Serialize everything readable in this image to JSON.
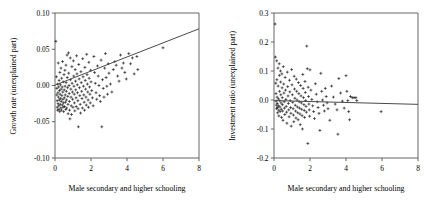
{
  "figure": {
    "background_color": "#ffffff",
    "panel_count": 2
  },
  "chart_data": [
    {
      "type": "scatter",
      "id": "growth-rate-panel",
      "title": "",
      "xlabel": "Male secondary and higher schooling",
      "ylabel": "Growth rate (unexplained part)",
      "xlim": [
        0,
        8
      ],
      "ylim": [
        -0.1,
        0.1
      ],
      "xticks": [
        0,
        2,
        4,
        6,
        8
      ],
      "xticklabels": [
        "0",
        "2",
        "4",
        "6",
        "8"
      ],
      "yticks": [
        -0.1,
        -0.05,
        0.0,
        0.05,
        0.1
      ],
      "yticklabels": [
        "-0.10",
        "-0.05",
        "0.00",
        "0.05",
        "0.10"
      ],
      "grid": false,
      "legend": null,
      "marker": "plus",
      "marker_color": "#0b0b0b",
      "fit_line": {
        "x": [
          0,
          8
        ],
        "y": [
          0.0005,
          0.0782
        ],
        "color": "#4a4a4a"
      },
      "points": [
        [
          0.05,
          0.061
        ],
        [
          0.08,
          0.012
        ],
        [
          0.1,
          -0.004
        ],
        [
          0.1,
          -0.013
        ],
        [
          0.12,
          -0.021
        ],
        [
          0.12,
          -0.03
        ],
        [
          0.14,
          -0.034
        ],
        [
          0.15,
          0.002
        ],
        [
          0.16,
          -0.01
        ],
        [
          0.17,
          -0.025
        ],
        [
          0.18,
          0.031
        ],
        [
          0.19,
          -0.016
        ],
        [
          0.2,
          -0.002
        ],
        [
          0.21,
          -0.028
        ],
        [
          0.22,
          -0.033
        ],
        [
          0.23,
          0.007
        ],
        [
          0.24,
          -0.02
        ],
        [
          0.25,
          -0.007
        ],
        [
          0.26,
          -0.036
        ],
        [
          0.27,
          0.018
        ],
        [
          0.28,
          -0.012
        ],
        [
          0.29,
          -0.026
        ],
        [
          0.3,
          0.001
        ],
        [
          0.31,
          -0.018
        ],
        [
          0.32,
          -0.031
        ],
        [
          0.33,
          0.024
        ],
        [
          0.34,
          -0.005
        ],
        [
          0.35,
          -0.022
        ],
        [
          0.36,
          -0.034
        ],
        [
          0.37,
          0.01
        ],
        [
          0.38,
          -0.014
        ],
        [
          0.4,
          -0.002
        ],
        [
          0.41,
          -0.027
        ],
        [
          0.42,
          0.033
        ],
        [
          0.43,
          -0.009
        ],
        [
          0.44,
          -0.019
        ],
        [
          0.45,
          -0.03
        ],
        [
          0.46,
          0.005
        ],
        [
          0.47,
          -0.024
        ],
        [
          0.48,
          -0.036
        ],
        [
          0.5,
          0.015
        ],
        [
          0.51,
          -0.006
        ],
        [
          0.52,
          -0.017
        ],
        [
          0.53,
          -0.029
        ],
        [
          0.55,
          0.021
        ],
        [
          0.56,
          -0.001
        ],
        [
          0.57,
          -0.013
        ],
        [
          0.58,
          -0.023
        ],
        [
          0.6,
          -0.033
        ],
        [
          0.61,
          0.028
        ],
        [
          0.62,
          0.004
        ],
        [
          0.63,
          -0.008
        ],
        [
          0.64,
          -0.02
        ],
        [
          0.65,
          -0.031
        ],
        [
          0.67,
          0.042
        ],
        [
          0.68,
          0.011
        ],
        [
          0.7,
          -0.003
        ],
        [
          0.71,
          -0.015
        ],
        [
          0.72,
          -0.026
        ],
        [
          0.73,
          -0.039
        ],
        [
          0.75,
          0.045
        ],
        [
          0.76,
          0.017
        ],
        [
          0.78,
          0.0
        ],
        [
          0.79,
          -0.011
        ],
        [
          0.8,
          -0.022
        ],
        [
          0.81,
          -0.034
        ],
        [
          0.83,
          -0.046
        ],
        [
          0.85,
          0.038
        ],
        [
          0.86,
          0.008
        ],
        [
          0.88,
          -0.005
        ],
        [
          0.89,
          -0.016
        ],
        [
          0.9,
          -0.028
        ],
        [
          0.92,
          -0.04
        ],
        [
          0.94,
          0.026
        ],
        [
          0.95,
          0.003
        ],
        [
          0.97,
          -0.009
        ],
        [
          0.98,
          -0.019
        ],
        [
          1.0,
          -0.03
        ],
        [
          1.02,
          0.034
        ],
        [
          1.04,
          0.013
        ],
        [
          1.05,
          -0.001
        ],
        [
          1.07,
          -0.012
        ],
        [
          1.08,
          -0.024
        ],
        [
          1.1,
          -0.035
        ],
        [
          1.12,
          0.022
        ],
        [
          1.14,
          0.006
        ],
        [
          1.15,
          -0.006
        ],
        [
          1.17,
          -0.017
        ],
        [
          1.18,
          -0.029
        ],
        [
          1.2,
          0.041
        ],
        [
          1.22,
          0.016
        ],
        [
          1.24,
          0.001
        ],
        [
          1.25,
          -0.01
        ],
        [
          1.27,
          -0.021
        ],
        [
          1.28,
          -0.032
        ],
        [
          1.3,
          -0.057
        ],
        [
          1.32,
          0.029
        ],
        [
          1.34,
          0.009
        ],
        [
          1.36,
          -0.003
        ],
        [
          1.38,
          -0.014
        ],
        [
          1.4,
          -0.026
        ],
        [
          1.42,
          -0.038
        ],
        [
          1.44,
          0.019
        ],
        [
          1.46,
          0.004
        ],
        [
          1.48,
          -0.008
        ],
        [
          1.5,
          -0.018
        ],
        [
          1.52,
          -0.031
        ],
        [
          1.54,
          0.037
        ],
        [
          1.56,
          0.012
        ],
        [
          1.58,
          -0.001
        ],
        [
          1.6,
          -0.013
        ],
        [
          1.62,
          -0.023
        ],
        [
          1.64,
          -0.034
        ],
        [
          1.66,
          0.025
        ],
        [
          1.68,
          0.007
        ],
        [
          1.7,
          -0.005
        ],
        [
          1.72,
          -0.016
        ],
        [
          1.74,
          -0.027
        ],
        [
          1.76,
          0.043
        ],
        [
          1.78,
          0.015
        ],
        [
          1.8,
          0.002
        ],
        [
          1.82,
          -0.009
        ],
        [
          1.84,
          -0.02
        ],
        [
          1.86,
          -0.03
        ],
        [
          1.88,
          0.032
        ],
        [
          1.9,
          0.01
        ],
        [
          1.92,
          -0.002
        ],
        [
          1.94,
          -0.012
        ],
        [
          1.96,
          -0.024
        ],
        [
          1.98,
          0.021
        ],
        [
          2.0,
          0.005
        ],
        [
          2.04,
          -0.007
        ],
        [
          2.08,
          -0.017
        ],
        [
          2.12,
          -0.028
        ],
        [
          2.16,
          0.04
        ],
        [
          2.2,
          0.018
        ],
        [
          2.24,
          0.003
        ],
        [
          2.28,
          -0.01
        ],
        [
          2.32,
          -0.019
        ],
        [
          2.36,
          0.027
        ],
        [
          2.4,
          0.013
        ],
        [
          2.44,
          0.0
        ],
        [
          2.48,
          -0.014
        ],
        [
          2.52,
          -0.022
        ],
        [
          2.56,
          0.035
        ],
        [
          2.6,
          -0.057
        ],
        [
          2.64,
          0.008
        ],
        [
          2.68,
          -0.004
        ],
        [
          2.72,
          -0.016
        ],
        [
          2.76,
          0.024
        ],
        [
          2.8,
          0.044
        ],
        [
          2.84,
          0.011
        ],
        [
          2.88,
          -0.001
        ],
        [
          2.92,
          -0.012
        ],
        [
          2.96,
          0.03
        ],
        [
          3.0,
          0.017
        ],
        [
          3.08,
          0.002
        ],
        [
          3.16,
          -0.009
        ],
        [
          3.24,
          0.022
        ],
        [
          3.32,
          0.033
        ],
        [
          3.4,
          0.028
        ],
        [
          3.48,
          0.013
        ],
        [
          3.56,
          0.006
        ],
        [
          3.64,
          0.042
        ],
        [
          3.72,
          0.024
        ],
        [
          3.8,
          0.031
        ],
        [
          3.88,
          0.018
        ],
        [
          3.96,
          0.009
        ],
        [
          4.1,
          0.044
        ],
        [
          4.2,
          0.03
        ],
        [
          4.3,
          0.038
        ],
        [
          4.4,
          0.016
        ],
        [
          4.55,
          0.04
        ],
        [
          4.6,
          0.022
        ],
        [
          6.0,
          0.052
        ]
      ]
    },
    {
      "type": "scatter",
      "id": "investment-ratio-panel",
      "title": "",
      "xlabel": "Male secondary and higher schooling",
      "ylabel": "Investment ratio (unexplained part)",
      "xlim": [
        0,
        8
      ],
      "ylim": [
        -0.2,
        0.3
      ],
      "xticks": [
        0,
        2,
        4,
        6,
        8
      ],
      "xticklabels": [
        "0",
        "2",
        "4",
        "6",
        "8"
      ],
      "yticks": [
        -0.2,
        -0.1,
        0.0,
        0.1,
        0.2,
        0.3
      ],
      "yticklabels": [
        "-0.2",
        "-0.1",
        "0.0",
        "0.1",
        "0.2",
        "0.3"
      ],
      "grid": false,
      "legend": null,
      "marker": "plus",
      "marker_color": "#0b0b0b",
      "fit_line": {
        "x": [
          0,
          8
        ],
        "y": [
          -0.002,
          -0.015
        ],
        "color": "#4a4a4a"
      },
      "points": [
        [
          0.06,
          0.262
        ],
        [
          0.08,
          0.148
        ],
        [
          0.1,
          0.058
        ],
        [
          0.11,
          0.022
        ],
        [
          0.12,
          -0.004
        ],
        [
          0.13,
          -0.018
        ],
        [
          0.14,
          -0.03
        ],
        [
          0.15,
          0.135
        ],
        [
          0.16,
          0.07
        ],
        [
          0.17,
          0.01
        ],
        [
          0.18,
          -0.012
        ],
        [
          0.19,
          -0.026
        ],
        [
          0.2,
          -0.044
        ],
        [
          0.22,
          0.11
        ],
        [
          0.23,
          0.048
        ],
        [
          0.24,
          0.004
        ],
        [
          0.25,
          -0.02
        ],
        [
          0.26,
          -0.035
        ],
        [
          0.27,
          -0.055
        ],
        [
          0.29,
          0.125
        ],
        [
          0.3,
          0.085
        ],
        [
          0.31,
          0.03
        ],
        [
          0.32,
          -0.002
        ],
        [
          0.33,
          -0.024
        ],
        [
          0.34,
          -0.04
        ],
        [
          0.36,
          0.1
        ],
        [
          0.37,
          0.062
        ],
        [
          0.38,
          0.018
        ],
        [
          0.39,
          -0.01
        ],
        [
          0.4,
          -0.032
        ],
        [
          0.42,
          -0.06
        ],
        [
          0.44,
          0.09
        ],
        [
          0.45,
          0.042
        ],
        [
          0.46,
          0.008
        ],
        [
          0.47,
          -0.016
        ],
        [
          0.48,
          -0.038
        ],
        [
          0.5,
          -0.07
        ],
        [
          0.52,
          0.115
        ],
        [
          0.54,
          0.055
        ],
        [
          0.55,
          0.024
        ],
        [
          0.57,
          -0.006
        ],
        [
          0.58,
          -0.028
        ],
        [
          0.6,
          -0.05
        ],
        [
          0.62,
          0.078
        ],
        [
          0.64,
          0.034
        ],
        [
          0.66,
          0.002
        ],
        [
          0.68,
          -0.022
        ],
        [
          0.7,
          -0.042
        ],
        [
          0.72,
          -0.08
        ],
        [
          0.74,
          0.096
        ],
        [
          0.76,
          0.046
        ],
        [
          0.78,
          0.014
        ],
        [
          0.8,
          -0.012
        ],
        [
          0.82,
          -0.034
        ],
        [
          0.84,
          -0.058
        ],
        [
          0.86,
          0.068
        ],
        [
          0.88,
          0.028
        ],
        [
          0.9,
          -0.002
        ],
        [
          0.92,
          -0.026
        ],
        [
          0.94,
          -0.046
        ],
        [
          0.96,
          -0.09
        ],
        [
          0.98,
          0.105
        ],
        [
          1.0,
          0.052
        ],
        [
          1.02,
          0.018
        ],
        [
          1.04,
          -0.008
        ],
        [
          1.06,
          -0.03
        ],
        [
          1.08,
          -0.052
        ],
        [
          1.1,
          -0.075
        ],
        [
          1.12,
          0.082
        ],
        [
          1.14,
          0.038
        ],
        [
          1.16,
          0.006
        ],
        [
          1.18,
          -0.018
        ],
        [
          1.2,
          -0.038
        ],
        [
          1.22,
          -0.062
        ],
        [
          1.24,
          0.072
        ],
        [
          1.26,
          0.03
        ],
        [
          1.28,
          0.0
        ],
        [
          1.3,
          -0.024
        ],
        [
          1.32,
          -0.044
        ],
        [
          1.34,
          -0.068
        ],
        [
          1.36,
          0.06
        ],
        [
          1.38,
          0.022
        ],
        [
          1.4,
          -0.006
        ],
        [
          1.42,
          -0.028
        ],
        [
          1.44,
          -0.048
        ],
        [
          1.46,
          -0.085
        ],
        [
          1.48,
          0.05
        ],
        [
          1.5,
          0.014
        ],
        [
          1.52,
          -0.01
        ],
        [
          1.54,
          -0.032
        ],
        [
          1.56,
          -0.054
        ],
        [
          1.58,
          -0.1
        ],
        [
          1.6,
          0.088
        ],
        [
          1.62,
          0.04
        ],
        [
          1.64,
          0.008
        ],
        [
          1.66,
          -0.016
        ],
        [
          1.68,
          -0.036
        ],
        [
          1.7,
          -0.06
        ],
        [
          1.72,
          0.064
        ],
        [
          1.74,
          0.026
        ],
        [
          1.76,
          -0.002
        ],
        [
          1.78,
          -0.022
        ],
        [
          1.8,
          -0.042
        ],
        [
          1.82,
          0.186
        ],
        [
          1.85,
          0.108
        ],
        [
          1.88,
          -0.15
        ],
        [
          1.9,
          0.044
        ],
        [
          1.92,
          0.012
        ],
        [
          1.94,
          -0.014
        ],
        [
          1.96,
          -0.034
        ],
        [
          1.98,
          -0.056
        ],
        [
          2.0,
          0.104
        ],
        [
          2.05,
          0.034
        ],
        [
          2.1,
          0.002
        ],
        [
          2.15,
          -0.02
        ],
        [
          2.2,
          -0.04
        ],
        [
          2.25,
          -0.064
        ],
        [
          2.3,
          0.056
        ],
        [
          2.35,
          0.02
        ],
        [
          2.4,
          -0.006
        ],
        [
          2.45,
          -0.026
        ],
        [
          2.5,
          -0.046
        ],
        [
          2.55,
          -0.105
        ],
        [
          2.6,
          0.092
        ],
        [
          2.65,
          0.03
        ],
        [
          2.7,
          0.0
        ],
        [
          2.75,
          -0.018
        ],
        [
          2.8,
          -0.038
        ],
        [
          2.85,
          0.04
        ],
        [
          2.9,
          0.012
        ],
        [
          2.95,
          -0.01
        ],
        [
          3.0,
          -0.03
        ],
        [
          3.1,
          -0.07
        ],
        [
          3.2,
          0.048
        ],
        [
          3.3,
          0.01
        ],
        [
          3.4,
          -0.014
        ],
        [
          3.5,
          -0.034
        ],
        [
          3.55,
          -0.118
        ],
        [
          3.6,
          0.074
        ],
        [
          3.7,
          0.024
        ],
        [
          3.8,
          -0.004
        ],
        [
          3.9,
          -0.028
        ],
        [
          4.0,
          0.084
        ],
        [
          4.05,
          0.03
        ],
        [
          4.1,
          -0.002
        ],
        [
          4.15,
          -0.04
        ],
        [
          4.2,
          -0.068
        ],
        [
          4.25,
          0.012
        ],
        [
          4.35,
          0.008
        ],
        [
          4.45,
          0.008
        ],
        [
          4.55,
          0.008
        ],
        [
          4.6,
          -0.002
        ],
        [
          5.95,
          -0.04
        ]
      ]
    }
  ]
}
